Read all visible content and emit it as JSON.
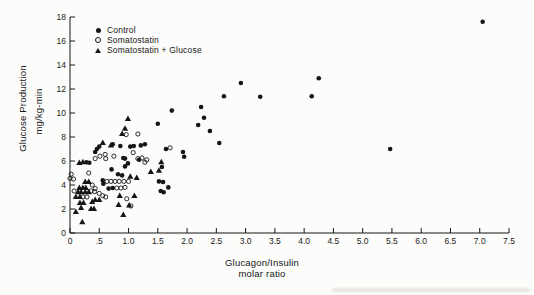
{
  "figure": {
    "background": "#fcfcfa",
    "ink": "#161616"
  },
  "legend": {
    "items": [
      {
        "label": "Control",
        "marker": "filled-circle"
      },
      {
        "label": "Somatostatin",
        "marker": "open-circle"
      },
      {
        "label": "Somatostatin + Glucose",
        "marker": "filled-triangle"
      }
    ]
  },
  "axes": {
    "y_title_line1": "Glucose Production",
    "y_title_line2": "mg/kg-min",
    "x_title_line1": "Glucagon/Insulin",
    "x_title_line2": "molar ratio",
    "x_tick_labels": [
      "0",
      ".5",
      "1.0",
      "1.5",
      "2.0",
      "2.5",
      "3.0",
      "3.5",
      "4.0",
      "4.5",
      "5.0",
      "5.5",
      "6.0",
      "6.5",
      "7.0",
      "7.5"
    ],
    "y_tick_labels": [
      "0",
      "2",
      "4",
      "6",
      "8",
      "10",
      "12",
      "14",
      "16",
      "18"
    ]
  },
  "chart_data": {
    "type": "scatter",
    "title": "",
    "xlabel": "Glucagon/Insulin molar ratio",
    "ylabel": "Glucose Production mg/kg-min",
    "xlim": [
      0,
      7.5
    ],
    "ylim": [
      0,
      18
    ],
    "grid": false,
    "legend_position": "upper-left-inside",
    "series": [
      {
        "name": "Control",
        "marker": "filled-circle",
        "points": [
          [
            0.43,
            6.75
          ],
          [
            0.46,
            7.0
          ],
          [
            0.5,
            7.2
          ],
          [
            0.28,
            5.9
          ],
          [
            0.33,
            5.85
          ],
          [
            0.73,
            7.4
          ],
          [
            0.86,
            7.25
          ],
          [
            1.03,
            7.2
          ],
          [
            1.09,
            7.25
          ],
          [
            1.21,
            7.3
          ],
          [
            1.28,
            7.4
          ],
          [
            0.91,
            6.25
          ],
          [
            0.94,
            6.2
          ],
          [
            0.99,
            5.8
          ],
          [
            0.94,
            5.55
          ],
          [
            1.18,
            6.1
          ],
          [
            0.71,
            5.3
          ],
          [
            0.82,
            4.9
          ],
          [
            0.89,
            4.8
          ],
          [
            0.56,
            4.4
          ],
          [
            0.57,
            4.1
          ],
          [
            0.66,
            3.7
          ],
          [
            0.73,
            3.75
          ],
          [
            1.52,
            4.3
          ],
          [
            1.59,
            4.25
          ],
          [
            1.55,
            3.5
          ],
          [
            1.6,
            3.4
          ],
          [
            1.68,
            3.8
          ],
          [
            1.57,
            5.5
          ],
          [
            1.64,
            7.0
          ],
          [
            1.93,
            6.75
          ],
          [
            1.95,
            6.35
          ],
          [
            1.5,
            9.1
          ],
          [
            1.74,
            10.2
          ],
          [
            2.24,
            10.5
          ],
          [
            2.29,
            9.6
          ],
          [
            2.19,
            9.0
          ],
          [
            2.39,
            8.5
          ],
          [
            2.55,
            7.5
          ],
          [
            2.63,
            11.4
          ],
          [
            2.92,
            12.5
          ],
          [
            3.25,
            11.35
          ],
          [
            4.13,
            11.4
          ],
          [
            4.25,
            12.9
          ],
          [
            5.47,
            7.0
          ],
          [
            7.05,
            17.6
          ]
        ]
      },
      {
        "name": "Somatostatin",
        "marker": "open-circle",
        "points": [
          [
            0.02,
            4.9
          ],
          [
            0.0,
            4.55
          ],
          [
            0.06,
            4.5
          ],
          [
            0.32,
            5.0
          ],
          [
            0.43,
            6.2
          ],
          [
            0.51,
            6.4
          ],
          [
            0.6,
            6.55
          ],
          [
            0.61,
            6.2
          ],
          [
            0.75,
            6.4
          ],
          [
            0.96,
            8.2
          ],
          [
            1.16,
            8.25
          ],
          [
            1.08,
            6.7
          ],
          [
            1.16,
            6.2
          ],
          [
            1.23,
            6.25
          ],
          [
            1.31,
            6.1
          ],
          [
            1.28,
            5.9
          ],
          [
            0.38,
            4.0
          ],
          [
            0.43,
            3.7
          ],
          [
            0.5,
            3.3
          ],
          [
            0.56,
            3.1
          ],
          [
            0.61,
            3.0
          ],
          [
            0.63,
            4.3
          ],
          [
            0.7,
            4.3
          ],
          [
            0.77,
            4.3
          ],
          [
            0.84,
            4.3
          ],
          [
            0.92,
            4.3
          ],
          [
            1.0,
            4.3
          ],
          [
            0.8,
            3.75
          ],
          [
            0.87,
            3.75
          ],
          [
            0.94,
            3.8
          ],
          [
            0.97,
            2.85
          ],
          [
            1.04,
            2.25
          ],
          [
            0.07,
            3.5
          ],
          [
            0.36,
            3.5
          ],
          [
            0.42,
            3.45
          ],
          [
            0.22,
            3.0
          ],
          [
            0.29,
            3.0
          ],
          [
            1.71,
            7.1
          ]
        ]
      },
      {
        "name": "Somatostatin + Glucose",
        "marker": "filled-triangle",
        "points": [
          [
            0.56,
            7.5
          ],
          [
            0.7,
            7.3
          ],
          [
            0.99,
            9.5
          ],
          [
            0.94,
            8.7
          ],
          [
            0.89,
            8.25
          ],
          [
            0.16,
            5.85
          ],
          [
            0.22,
            5.9
          ],
          [
            0.26,
            4.25
          ],
          [
            0.32,
            4.25
          ],
          [
            0.16,
            3.75
          ],
          [
            0.22,
            3.75
          ],
          [
            0.27,
            3.75
          ],
          [
            0.14,
            3.4
          ],
          [
            0.19,
            3.4
          ],
          [
            0.26,
            3.4
          ],
          [
            0.32,
            3.4
          ],
          [
            0.1,
            3.0
          ],
          [
            0.17,
            3.0
          ],
          [
            0.17,
            2.5
          ],
          [
            0.23,
            2.5
          ],
          [
            0.38,
            2.6
          ],
          [
            0.19,
            2.1
          ],
          [
            0.36,
            2.0
          ],
          [
            0.41,
            2.0
          ],
          [
            0.1,
            1.75
          ],
          [
            0.21,
            0.9
          ],
          [
            0.43,
            2.75
          ],
          [
            0.5,
            2.75
          ],
          [
            0.85,
            3.1
          ],
          [
            0.83,
            2.35
          ],
          [
            0.91,
            1.5
          ],
          [
            1.01,
            2.3
          ],
          [
            1.1,
            3.1
          ],
          [
            1.03,
            4.7
          ],
          [
            1.14,
            4.6
          ],
          [
            1.38,
            5.1
          ],
          [
            1.52,
            5.2
          ],
          [
            1.56,
            5.9
          ]
        ]
      }
    ]
  }
}
